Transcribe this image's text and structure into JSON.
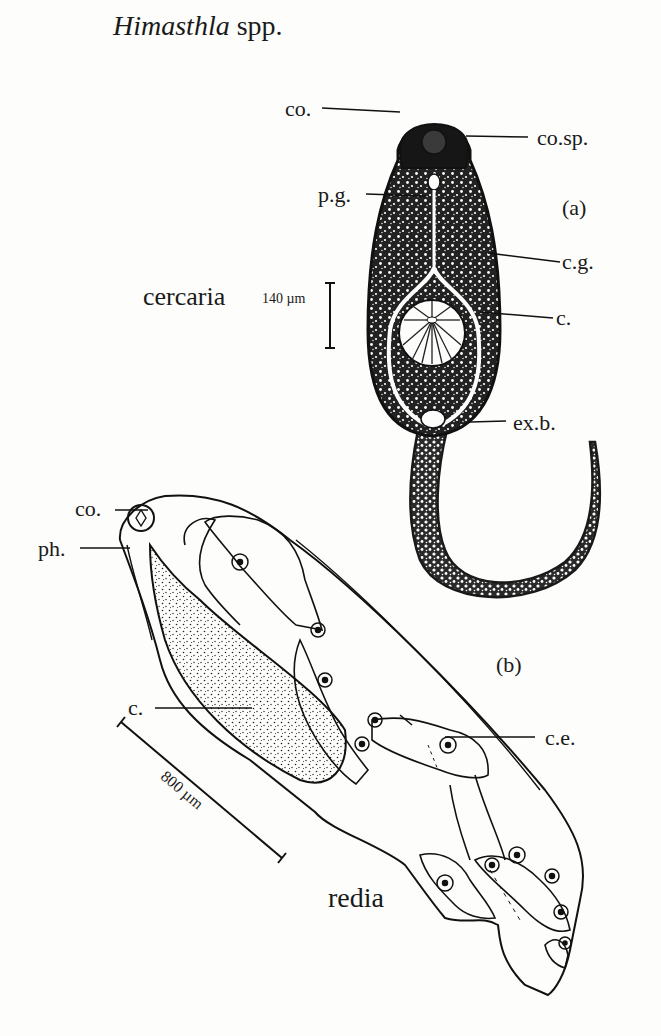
{
  "figure": {
    "title_genus": "Himasthla",
    "title_suffix": "spp.",
    "background": "#fdfdfb",
    "ink_color": "#1a1a1a"
  },
  "panel_a": {
    "panel_label": "(a)",
    "stage_name": "cercaria",
    "scale_bar": "140 µm",
    "labels": {
      "co": "co.",
      "co_sp": "co.sp.",
      "p_g": "p.g.",
      "c_g": "c.g.",
      "c": "c.",
      "ex_b": "ex.b."
    }
  },
  "panel_b": {
    "panel_label": "(b)",
    "stage_name": "redia",
    "scale_bar": "800 µm",
    "labels": {
      "co": "co.",
      "ph": "ph.",
      "c": "c.",
      "c_e": "c.e."
    }
  }
}
